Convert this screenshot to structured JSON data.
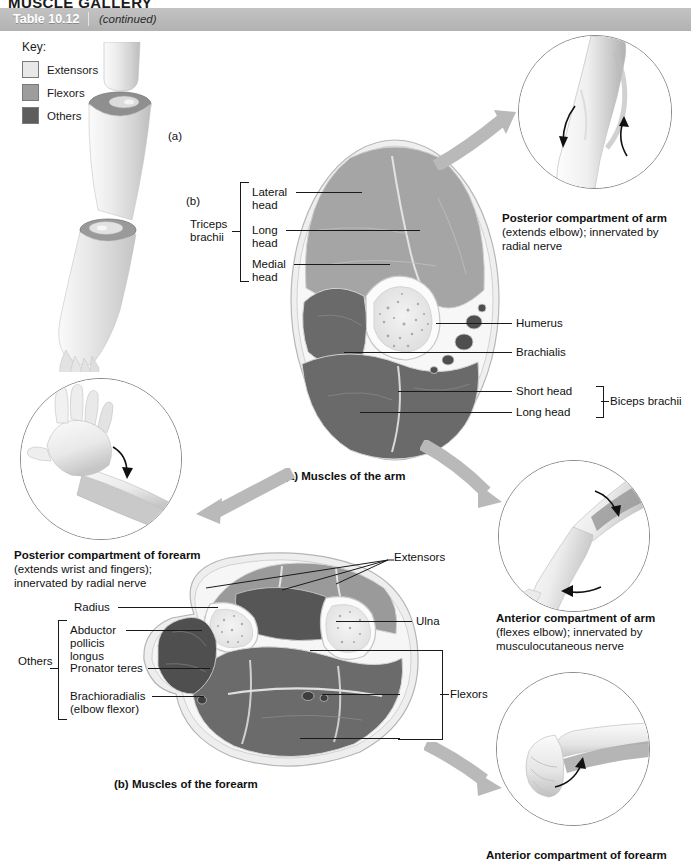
{
  "page": {
    "gallery_title": "MUSCLE GALLERY",
    "table_number": "Table 10.12",
    "table_continued": "(continued)"
  },
  "key": {
    "title": "Key:",
    "items": [
      {
        "label": "Extensors",
        "color": "#e8e8e8"
      },
      {
        "label": "Flexors",
        "color": "#9d9d9d"
      },
      {
        "label": "Others",
        "color": "#5d5d5d"
      }
    ]
  },
  "orientation": {
    "level_a": "(a)",
    "level_b": "(b)"
  },
  "arm_section": {
    "caption": "(a) Muscles of the arm",
    "bracket_left_label": "Triceps\nbrachii",
    "left_labels": [
      "Lateral\nhead",
      "Long\nhead",
      "Medial\nhead"
    ],
    "right_labels": [
      "Humerus",
      "Brachialis"
    ],
    "bracket_right_label": "Biceps brachii",
    "bracket_right_items": [
      "Short head",
      "Long head"
    ]
  },
  "forearm_section": {
    "caption": "(b) Muscles of the forearm",
    "bracket_left_label": "Others",
    "left_labels": [
      "Radius",
      "Abductor\npollicis\nlongus",
      "Pronator teres",
      "Brachioradialis\n(elbow flexor)"
    ],
    "right_labels": [
      "Extensors",
      "Ulna",
      "Flexors"
    ]
  },
  "insets": [
    {
      "id": "posterior-arm",
      "title": "Posterior compartment of arm",
      "detail": "(extends elbow); innervated by\nradial nerve"
    },
    {
      "id": "anterior-arm",
      "title": "Anterior compartment of arm",
      "detail": "(flexes elbow); innervated by\nmusculocutaneous nerve"
    },
    {
      "id": "posterior-forearm",
      "title": "Posterior compartment of forearm",
      "detail": "(extends wrist and fingers);\ninnervated by radial nerve"
    },
    {
      "id": "anterior-forearm",
      "title": "Anterior compartment of forearm",
      "detail": ""
    }
  ]
}
